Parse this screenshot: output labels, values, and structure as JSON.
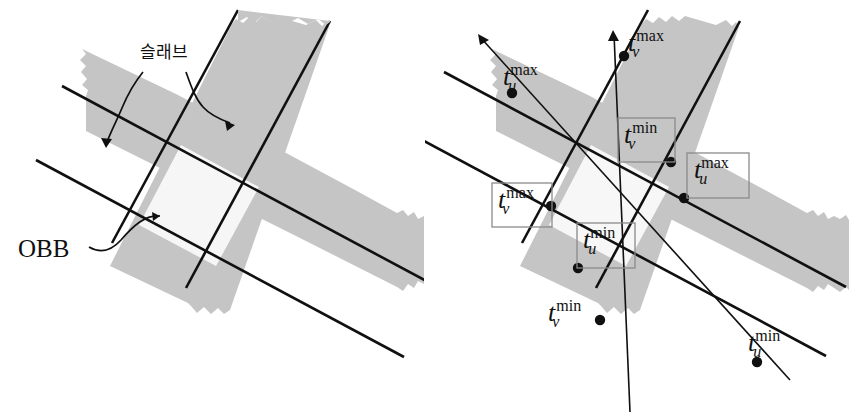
{
  "figure": {
    "background_color": "#ffffff",
    "slab_fill_color": "#c5c5c5",
    "obb_fill_color": "#f4f4f4",
    "line_color": "#101010",
    "panels": [
      {
        "id": "left-panel",
        "name": "slab-and-obb-panel",
        "annotations": [
          {
            "id": "slab-label",
            "text": "슬래브",
            "meaning": "slab"
          },
          {
            "id": "obb-label",
            "text": "OBB",
            "meaning": "oriented bounding box"
          }
        ],
        "leader_arrows": 3
      },
      {
        "id": "right-panel",
        "name": "ray-parameter-panel",
        "rays": 2,
        "intersection_points": 8,
        "point_labels": [
          {
            "id": "tu-max-left",
            "base": "t",
            "sub": "u",
            "sup": "max",
            "boxed": false
          },
          {
            "id": "tv-max-top",
            "base": "t",
            "sub": "v",
            "sup": "max",
            "boxed": false
          },
          {
            "id": "tv-min-boxed",
            "base": "t",
            "sub": "v",
            "sup": "min",
            "boxed": true
          },
          {
            "id": "tu-max-boxed",
            "base": "t",
            "sub": "u",
            "sup": "max",
            "boxed": true
          },
          {
            "id": "tv-max-boxed",
            "base": "t",
            "sub": "v",
            "sup": "max",
            "boxed": true
          },
          {
            "id": "tu-min-boxed",
            "base": "t",
            "sub": "u",
            "sup": "min",
            "boxed": true
          },
          {
            "id": "tv-min-bottom",
            "base": "t",
            "sub": "v",
            "sup": "min",
            "boxed": false
          },
          {
            "id": "tu-min-right",
            "base": "t",
            "sub": "u",
            "sup": "min",
            "boxed": false
          }
        ]
      }
    ]
  }
}
